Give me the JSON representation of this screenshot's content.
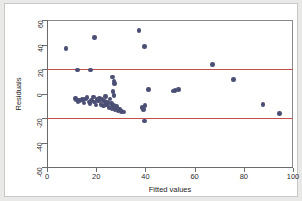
{
  "figure": {
    "background_color": "#ffffff",
    "page_background_color": "#e9e9e7",
    "marker_color": "#4b4f74",
    "refline_color": "#c0504d",
    "axis_color": "#6b6b6b"
  },
  "chart_data": {
    "type": "scatter",
    "title": "",
    "xlabel": "Fitted values",
    "ylabel": "Residuals",
    "xlim": [
      0,
      100
    ],
    "ylim": [
      -60,
      60
    ],
    "xticks": [
      0,
      20,
      40,
      60,
      80,
      100
    ],
    "yticks": [
      -60,
      -40,
      -20,
      0,
      20,
      40,
      60
    ],
    "xticklabels": [
      "0",
      "20",
      "40",
      "60",
      "80",
      "100"
    ],
    "yticklabels": [
      "-60",
      "-40",
      "-20",
      "0",
      "20",
      "40",
      "60"
    ],
    "grid": false,
    "legend": null,
    "reference_lines": [
      {
        "name": "upper-threshold",
        "orientation": "horizontal",
        "y": 20,
        "color": "#c0504d"
      },
      {
        "name": "lower-threshold",
        "orientation": "horizontal",
        "y": -20,
        "color": "#c0504d"
      }
    ],
    "points": [
      {
        "x": 7.8,
        "y": 36.6
      },
      {
        "x": 12.3,
        "y": 19.3
      },
      {
        "x": 17.6,
        "y": 19.2
      },
      {
        "x": 19.4,
        "y": 45.8
      },
      {
        "x": 37.4,
        "y": 51.2
      },
      {
        "x": 39.7,
        "y": 38.6
      },
      {
        "x": 67.2,
        "y": 23.7
      },
      {
        "x": 75.7,
        "y": 11.3
      },
      {
        "x": 26.6,
        "y": 13.5
      },
      {
        "x": 27.2,
        "y": 10.2
      },
      {
        "x": 27.4,
        "y": 8.2
      },
      {
        "x": 26.9,
        "y": 1.5
      },
      {
        "x": 27.3,
        "y": -1.8
      },
      {
        "x": 41.2,
        "y": 3.3
      },
      {
        "x": 51.2,
        "y": 2.2
      },
      {
        "x": 52.0,
        "y": 2.6
      },
      {
        "x": 53.4,
        "y": 3.5
      },
      {
        "x": 11.6,
        "y": -4.1
      },
      {
        "x": 12.1,
        "y": -5.3
      },
      {
        "x": 12.6,
        "y": -6.4
      },
      {
        "x": 13.2,
        "y": -5.8
      },
      {
        "x": 14.4,
        "y": -5.0
      },
      {
        "x": 15.1,
        "y": -7.6
      },
      {
        "x": 15.7,
        "y": -4.4
      },
      {
        "x": 16.3,
        "y": -3.2
      },
      {
        "x": 17.0,
        "y": -6.9
      },
      {
        "x": 17.5,
        "y": -8.4
      },
      {
        "x": 18.1,
        "y": -5.5
      },
      {
        "x": 18.8,
        "y": -2.8
      },
      {
        "x": 19.3,
        "y": -7.1
      },
      {
        "x": 19.9,
        "y": -9.5
      },
      {
        "x": 20.4,
        "y": -4.8
      },
      {
        "x": 20.9,
        "y": -6.2
      },
      {
        "x": 21.4,
        "y": -3.9
      },
      {
        "x": 21.9,
        "y": -8.8
      },
      {
        "x": 22.4,
        "y": -5.1
      },
      {
        "x": 22.9,
        "y": -10.2
      },
      {
        "x": 23.3,
        "y": -6.7
      },
      {
        "x": 23.8,
        "y": -2.4
      },
      {
        "x": 24.2,
        "y": -9.1
      },
      {
        "x": 24.7,
        "y": -7.3
      },
      {
        "x": 25.2,
        "y": -11.4
      },
      {
        "x": 25.6,
        "y": -4.6
      },
      {
        "x": 26.1,
        "y": -8.0
      },
      {
        "x": 26.5,
        "y": -12.1
      },
      {
        "x": 27.0,
        "y": -9.8
      },
      {
        "x": 27.6,
        "y": -13.2
      },
      {
        "x": 28.2,
        "y": -10.7
      },
      {
        "x": 28.8,
        "y": -14.3
      },
      {
        "x": 29.4,
        "y": -12.6
      },
      {
        "x": 30.2,
        "y": -14.8
      },
      {
        "x": 31.3,
        "y": -15.1
      },
      {
        "x": 38.6,
        "y": -11.2
      },
      {
        "x": 39.2,
        "y": -13.0
      },
      {
        "x": 39.9,
        "y": -9.9
      },
      {
        "x": 39.6,
        "y": -22.4
      },
      {
        "x": 87.8,
        "y": -8.9
      },
      {
        "x": 94.6,
        "y": -16.4
      }
    ]
  }
}
